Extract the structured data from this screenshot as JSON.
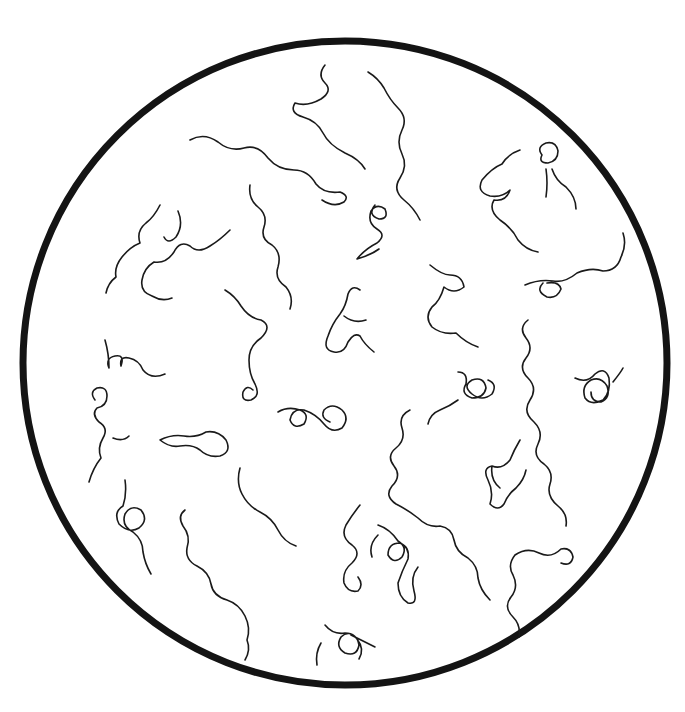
{
  "illustration": {
    "subject": "microscope field with spiral organisms",
    "circle": {
      "cx": 345,
      "cy": 363,
      "r": 322
    },
    "colors": {
      "background": "#ffffff",
      "ink": "#1a1a1a",
      "rim": "#141414"
    },
    "organisms": [
      "M325 65 q-8 10 0 18 q8 8 -4 16 q-14 8 -26 4 q-6 10 8 14 q14 4 20 16 q6 12 22 20 q14 6 20 16",
      "M368 72 q10 6 16 16 q6 12 14 20 q10 10 4 22 q-6 12 0 24 q6 12 -2 24 q-8 12 4 22 q10 8 16 20",
      "M190 140 q14 -8 28 2 q12 10 26 6 q14 -4 24 10 q10 12 26 12 q14 0 22 14 q8 10 24 8 q10 4 4 10 q-10 6 -22 -2",
      "M520 150 q-12 4 -18 14 q-10 4 -20 16 q-6 12 8 16 q12 2 20 -6 q-4 12 -16 10 q-6 10 6 20 q12 8 18 20 q8 10 20 12",
      "M542 155 q-6 -8 4 -12 q10 -2 12 8 q0 10 -10 12 q-10 0 -6 -8 m4 14 q2 14 0 28 m6 -28 q4 12 14 18 q10 10 10 22",
      "M160 205 q-6 12 -14 18 q-10 8 -6 20 q-10 4 -18 14 q-8 10 -6 20 q-8 6 -10 16 m72 -82 q6 14 -2 26 q-8 8 -12 0",
      "M250 185 q-2 14 8 22 q10 8 6 20 q-4 12 8 18 q10 8 6 22 q-4 12 8 20 q8 10 4 22",
      "M375 205 q-8 10 4 14 q10 0 6 -10 q-8 -6 -14 2 q-4 12 6 18 q10 6 0 14 q-12 6 -20 16 q14 -4 22 -10",
      "M230 230 q-10 10 -20 16 q-12 8 -20 0 q-10 -6 -16 6 q-8 12 -20 10 q-10 6 -12 18 q-2 12 10 16 q10 6 20 2",
      "M430 265 q12 10 20 10 q12 0 14 12 q-10 8 -20 0 q-4 14 -12 20 q-8 10 0 20 q10 8 24 6 q10 10 22 14",
      "M525 285 q14 -6 28 -4 q12 2 24 -8 q14 -6 26 -2 q14 0 18 -14 q6 -12 2 -24 m-80 50 q-8 8 4 14 q10 2 14 -8 q-2 -8 -14 -6",
      "M360 290 q-8 -6 -12 4 q-2 12 -8 20 q-8 10 -12 22 q-6 14 6 16 q10 2 14 -10 q6 -10 12 -6 q4 8 14 16 m-30 -36 q10 8 22 4",
      "M225 290 q10 6 16 16 q8 12 20 14 q12 6 0 18 q-12 8 -12 22 q0 14 6 24 q6 12 -4 16 q-10 2 -8 -8 q4 -8 10 -2",
      "M105 340 q4 14 4 28 q-4 -10 6 -12 q10 -2 6 10 q-2 -10 8 -8 q10 2 14 12 q8 10 22 4",
      "M528 320 q-10 8 -2 18 q8 10 0 20 q-8 10 2 20 q10 10 2 22 q-8 12 4 22 q10 10 4 22 q-6 12 6 20 q10 8 6 20 q-4 12 8 22 q10 8 8 20",
      "M575 378 q12 6 20 -4 q10 -8 14 4 q2 14 -6 22 q-12 6 -18 -2 q-4 -12 6 -18 q10 -4 16 6 q4 12 -6 16 q-10 0 -10 -10 m22 -10 q8 -10 10 -14",
      "M458 372 q10 0 8 12 q-6 10 6 14 q12 0 14 -10 q-2 -12 -14 -8 q-10 6 0 14 q10 8 20 0 q6 -10 -4 -14 m-30 20 q-8 6 -18 10 q-10 4 -12 14",
      "M278 412 q10 -6 22 -2 q10 4 4 14 q-10 6 -14 -4 q2 -12 14 -10 q12 4 20 14 q8 10 18 4 q8 -10 0 -18 q-10 -8 -18 0 q-4 8 6 12",
      "M95 400 q-6 -8 2 -12 q10 -2 10 8 q0 10 -10 12 q-6 6 2 14 q10 6 4 16 q-6 10 -2 20 q-8 10 -12 24 m24 -44 q10 4 16 -2",
      "M160 440 q12 -6 24 -4 q12 2 22 -4 q12 -2 20 8 q6 12 -6 16 q-12 2 -20 -6 q-8 -6 -20 -4 q-10 2 -20 -6",
      "M410 410 q-12 6 -8 18 q4 12 -6 20 q-10 8 -2 18 q8 10 -2 20 q-8 10 4 18 q12 6 22 14 q10 10 22 8 q12 2 14 14 q2 12 14 18 q10 8 10 20 q2 12 12 22",
      "M520 440 q-6 10 -10 20 q-8 10 -18 6 q-10 2 -4 14 q6 12 2 24 q8 8 14 0 q4 -10 12 -16 q8 -8 10 -18 m-26 18 q-10 -8 -8 -22",
      "M125 480 q2 14 -2 26 q-10 6 -4 18 q10 10 20 4 q10 -8 2 -18 q-10 -6 -16 4 q-4 12 8 18 q10 8 10 20 q2 12 8 22",
      "M240 468 q-4 14 2 26 q6 12 18 18 q12 6 18 18 q6 12 18 16",
      "M185 510 q-8 6 -2 16 q8 10 4 22 q-2 12 10 18 q12 6 14 18 q2 12 16 16 q12 4 18 16 q6 12 2 24 q4 10 -2 20",
      "M360 505 q-8 10 -14 20 q-6 12 6 20 q10 8 0 18 q-10 8 -8 20 q4 10 14 8 q6 -6 0 -14 m20 -42 q-10 10 -6 22",
      "M378 525 q12 4 20 16 q10 6 4 16 q-8 8 -14 -2 q0 -12 12 -12 q10 4 8 16 q-6 12 -10 24 q0 14 10 20 q10 2 6 -12 q-4 -14 4 -24",
      "M515 555 q12 -8 24 -2 q12 6 22 -4 q10 -2 12 8 q-2 10 -12 6 m-46 -8 q-8 10 -2 20 q6 12 -2 22 q-8 10 2 20 q8 8 6 20",
      "M325 625 q8 10 20 8 q12 0 14 12 q-2 12 -14 8 q-10 -6 -4 -16 q8 -8 16 2 q8 10 2 20 m-8 -24 q12 6 24 12 m-54 -4 q-6 10 -4 22"
    ]
  }
}
